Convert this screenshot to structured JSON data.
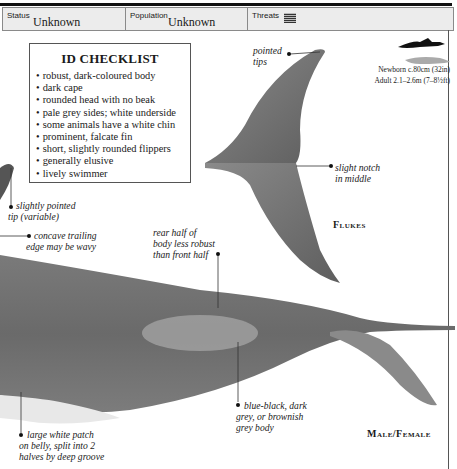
{
  "status_bar": {
    "status": {
      "label": "Status",
      "value": "Unknown"
    },
    "population": {
      "label": "Population",
      "value": "Unknown"
    },
    "threats": {
      "label": "Threats",
      "icon": "threats-grid-icon"
    }
  },
  "checklist": {
    "title": "ID CHECKLIST",
    "items": [
      "robust, dark-coloured body",
      "dark cape",
      "rounded head with no beak",
      "pale grey sides; white underside",
      "some animals have a white chin",
      "prominent, falcate fin",
      "short, slightly rounded flippers",
      "generally elusive",
      "lively swimmer"
    ]
  },
  "size_scale": {
    "newborn": "Newborn c.80cm (32in)",
    "adult": "Adult 2.1–2.6m (7–8½ft)"
  },
  "annotations": {
    "pointed_tips": [
      "pointed",
      "tips"
    ],
    "slight_notch": [
      "slight notch",
      "in middle"
    ],
    "slightly_pointed_tip": [
      "slightly pointed",
      "tip (variable)"
    ],
    "concave_trailing": [
      "concave trailing",
      "edge may be wavy"
    ],
    "rear_half": [
      "rear half of",
      "body less robust",
      "than front half"
    ],
    "blue_black": [
      "blue-black, dark",
      "grey, or brownish",
      "grey body"
    ],
    "white_patch": [
      "large white patch",
      "on belly, split into 2",
      "halves by deep groove"
    ]
  },
  "labels": {
    "flukes": "Flukes",
    "male_female": "Male/Female"
  },
  "colors": {
    "body": "#6f6f6f",
    "fluke": "#7a7a7a",
    "patch": "#a3a3a3",
    "statusbar_bg": "#ececec"
  }
}
